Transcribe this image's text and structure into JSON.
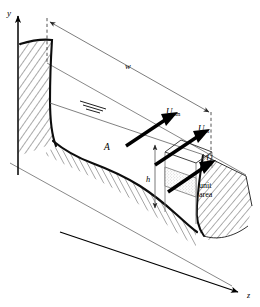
{
  "figure": {
    "axes": {
      "y_label": "y",
      "z_label": "z"
    },
    "dimensions": {
      "width_label": "w",
      "depth_label": "h"
    },
    "area_label": "A",
    "velocity_labels": {
      "u_om_base": "U",
      "u_om_sub": "om",
      "u_m_base": "U",
      "u_m_sub": "m",
      "u_base": "U",
      "u_sub": ""
    },
    "unit_area": {
      "line1": "unit",
      "line2": "area"
    },
    "colors": {
      "ink": "#000000",
      "thin_line": "#555555",
      "dimension_line": "#5a5a5a",
      "stipple": "#9a9a9a",
      "background": "#ffffff"
    }
  }
}
